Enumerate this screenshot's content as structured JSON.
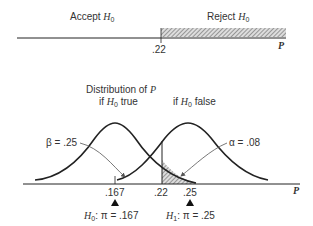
{
  "top_axis": {
    "accept_label": "Accept",
    "reject_label": "Reject",
    "hypothesis": "H",
    "hypothesis_sub": "0",
    "critical_value": ".22",
    "axis_label": "P"
  },
  "bottom_chart": {
    "title_line1": "Distribution of",
    "title_var": "P",
    "h0_true_prefix": "if",
    "h0_true_suffix": "true",
    "h0_false_prefix": "if",
    "h0_false_suffix": "false",
    "beta_label": "β = .25",
    "alpha_label": "α = .08",
    "ticks": [
      ".167",
      ".22",
      ".25"
    ],
    "axis_label": "P",
    "h0_marker": "H",
    "h0_marker_sub": "0",
    "h0_value": ": π = .167",
    "h1_marker": "H",
    "h1_marker_sub": "1",
    "h1_value": ": π = .25"
  },
  "colors": {
    "line": "#222222",
    "arrow": "#555555",
    "hatch": "#777777"
  }
}
